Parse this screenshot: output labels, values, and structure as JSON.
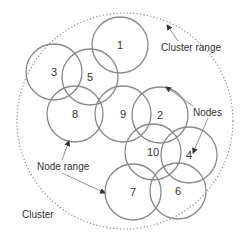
{
  "diagram": {
    "cluster": {
      "label": "Cluster",
      "center": [
        125,
        121
      ],
      "radius": 108,
      "style": "dotted"
    },
    "node_radius": 28,
    "nodes": [
      {
        "id": "1",
        "label": "1",
        "cx": 120,
        "cy": 45
      },
      {
        "id": "2",
        "label": "2",
        "cx": 160,
        "cy": 115
      },
      {
        "id": "3",
        "label": "3",
        "cx": 54,
        "cy": 72
      },
      {
        "id": "4",
        "label": "4",
        "cx": 189,
        "cy": 155
      },
      {
        "id": "5",
        "label": "5",
        "cx": 90,
        "cy": 77
      },
      {
        "id": "6",
        "label": "6",
        "cx": 178,
        "cy": 191
      },
      {
        "id": "7",
        "label": "7",
        "cx": 133,
        "cy": 192
      },
      {
        "id": "8",
        "label": "8",
        "cx": 75,
        "cy": 114
      },
      {
        "id": "9",
        "label": "9",
        "cx": 123,
        "cy": 114
      },
      {
        "id": "10",
        "label": "10",
        "cx": 153,
        "cy": 152
      }
    ],
    "annotations": {
      "cluster_range": {
        "label": "Cluster range",
        "x": 161,
        "y": 48
      },
      "nodes": {
        "label": "Nodes",
        "x": 193,
        "y": 113
      },
      "node_range": {
        "label": "Node range",
        "x": 37,
        "y": 167
      },
      "cluster": {
        "label": "Cluster",
        "x": 22,
        "y": 218
      }
    },
    "colors": {
      "stroke": "#8a8a8a",
      "text": "#333333",
      "background": "#ffffff"
    }
  }
}
